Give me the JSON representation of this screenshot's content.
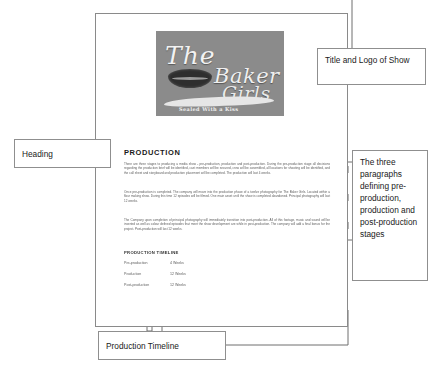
{
  "document": {
    "logo": {
      "word_the": "The",
      "word_baker": "Baker",
      "word_girls": "Girls",
      "tagline": "Sealed With a Kiss"
    },
    "heading": "PRODUCTION",
    "paragraphs": [
      "There are three stages to producing a media show - pre-production, production and post-production. During the pre-production stage all decisions regarding the production brief will be identified, cast members will be secured, crew will be assembled, all locations for shooting will be identified, and the call sheet and storyboard and production placement will be completed. The production will last 4 weeks.",
      "Once pre-production is completed. The company will move into the production phase of a twelve photography for The Baker Girls. Located within a flour making show. During this time 12 episodes will be filmed. One main asset until the show is completed abandoned. Principal photography will last 12 weeks.",
      "The Company upon completion of principal photography will immediately transition into post-production. All of this footage, music and sound will be inserted as well as colour defined episodes that meet the show development are while in post-production. The company will add a final bonus for the project. Post-production will last 12 weeks."
    ],
    "timeline": {
      "heading": "PRODUCTION TIMELINE",
      "rows": [
        {
          "label": "Pre-production",
          "value": "4 Weeks"
        },
        {
          "label": "Production",
          "value": "12 Weeks"
        },
        {
          "label": "Post-production",
          "value": "12 Weeks"
        }
      ]
    }
  },
  "annotations": {
    "title_logo": "Title and Logo of Show",
    "heading": "Heading",
    "paragraphs": "The three paragraphs defining pre-production, production and post-production stages",
    "timeline": "Production Timeline"
  },
  "colors": {
    "page_border": "#8a8a8a",
    "box_border": "#8f8f8f",
    "connector": "#6f6f6f",
    "logo_bg": "#8b8b8b",
    "text": "#1a1a1a",
    "body_text": "#5e5e5e"
  }
}
